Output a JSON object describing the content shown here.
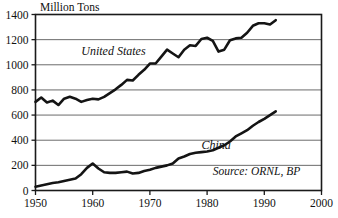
{
  "chart_data": {
    "type": "line",
    "title": "Million Tons",
    "xlabel": "",
    "ylabel": "Million Tons",
    "xlim": [
      1950,
      2000
    ],
    "ylim": [
      0,
      1400
    ],
    "xticks": [
      "1950",
      "1960",
      "1970",
      "1980",
      "1990",
      "2000"
    ],
    "yticks": [
      "0",
      "200",
      "400",
      "600",
      "800",
      "1000",
      "1200",
      "1400"
    ],
    "grid": "horizontal",
    "legend_position": "inline-annotations",
    "annotations": [
      {
        "text": "United States",
        "x": 1958,
        "y": 1075
      },
      {
        "text": "China",
        "x": 1979,
        "y": 330
      },
      {
        "text": "Source: ORNL, BP",
        "x": 1981,
        "y": 120
      }
    ],
    "line_color": "#141414",
    "grid_color": "#5a5a5a",
    "series": [
      {
        "name": "United States",
        "x": [
          1950,
          1951,
          1952,
          1953,
          1954,
          1955,
          1956,
          1957,
          1958,
          1959,
          1960,
          1961,
          1962,
          1963,
          1964,
          1965,
          1966,
          1967,
          1968,
          1969,
          1970,
          1971,
          1972,
          1973,
          1974,
          1975,
          1976,
          1977,
          1978,
          1979,
          1980,
          1981,
          1982,
          1983,
          1984,
          1985,
          1986,
          1987,
          1988,
          1989,
          1990,
          1991,
          1992
        ],
        "values": [
          705,
          740,
          700,
          715,
          680,
          730,
          745,
          730,
          705,
          720,
          730,
          725,
          745,
          775,
          805,
          840,
          880,
          875,
          920,
          960,
          1010,
          1010,
          1065,
          1120,
          1090,
          1060,
          1120,
          1155,
          1150,
          1205,
          1215,
          1190,
          1105,
          1120,
          1195,
          1210,
          1215,
          1255,
          1310,
          1330,
          1330,
          1320,
          1355
        ]
      },
      {
        "name": "China",
        "x": [
          1950,
          1951,
          1952,
          1953,
          1954,
          1955,
          1956,
          1957,
          1958,
          1959,
          1960,
          1961,
          1962,
          1963,
          1964,
          1965,
          1966,
          1967,
          1968,
          1969,
          1970,
          1971,
          1972,
          1973,
          1974,
          1975,
          1976,
          1977,
          1978,
          1979,
          1980,
          1981,
          1982,
          1983,
          1984,
          1985,
          1986,
          1987,
          1988,
          1989,
          1990,
          1991,
          1992
        ],
        "values": [
          30,
          40,
          50,
          60,
          65,
          75,
          85,
          95,
          130,
          180,
          215,
          175,
          145,
          140,
          140,
          145,
          150,
          135,
          140,
          155,
          165,
          180,
          190,
          200,
          215,
          255,
          270,
          290,
          300,
          305,
          310,
          320,
          340,
          360,
          390,
          430,
          455,
          480,
          515,
          545,
          570,
          600,
          630
        ]
      }
    ]
  }
}
